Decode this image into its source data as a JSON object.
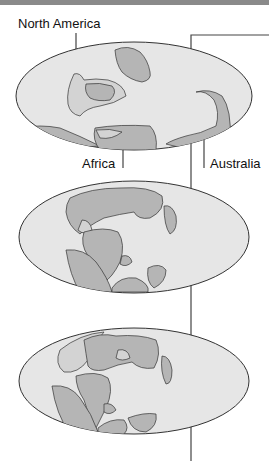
{
  "labels": {
    "north_america": "North America",
    "africa": "Africa",
    "australia": "Australia"
  },
  "colors": {
    "ocean": "#e6e6e6",
    "land": "#b5b5b5",
    "land_light": "#d3d3d3",
    "outline": "#333333",
    "line": "#444444",
    "topbar": "#8a8a8a"
  },
  "globes": [
    {
      "name": "globe-1",
      "cx": 134,
      "cy": 95,
      "rx": 118,
      "ry": 54
    },
    {
      "name": "globe-2",
      "cx": 134,
      "cy": 237,
      "rx": 115,
      "ry": 56
    },
    {
      "name": "globe-3",
      "cx": 134,
      "cy": 381,
      "rx": 115,
      "ry": 53
    }
  ]
}
